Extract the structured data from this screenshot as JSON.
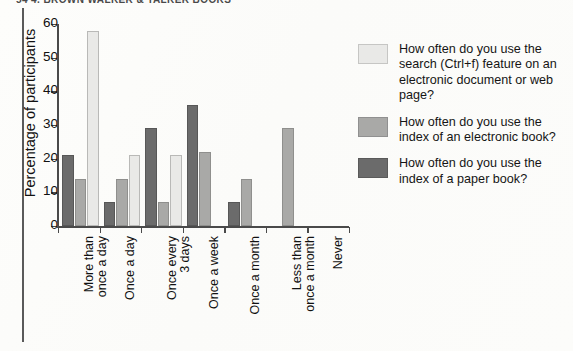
{
  "page": {
    "running_header": "54    4. BROWN WALKER & TALKER BOOKS"
  },
  "chart_data": {
    "type": "bar",
    "title": "",
    "subtitle": "",
    "xlabel": "",
    "ylabel": "Percentage of participants",
    "ylim": [
      0,
      60
    ],
    "yticks": [
      0,
      10,
      20,
      30,
      40,
      50,
      60
    ],
    "grid": false,
    "legend_position": "right",
    "categories": [
      "More than\nonce a day",
      "Once a day",
      "Once every\n3 days",
      "Once a week",
      "Once a month",
      "Less than\nonce a month",
      "Never"
    ],
    "series": [
      {
        "name": "How often do you use the search (Ctrl+f) feature on an electronic document or web page?",
        "color": "#e9e9e7",
        "values": [
          58,
          21,
          21,
          0,
          0,
          0,
          0
        ]
      },
      {
        "name": "How often do you use the index of an electronic book?",
        "color": "#a9a9a7",
        "values": [
          14,
          14,
          7,
          22,
          14,
          29,
          0
        ]
      },
      {
        "name": "How often do you use the index of a paper book?",
        "color": "#6b6b6b",
        "values": [
          21,
          7,
          29,
          36,
          7,
          0,
          0
        ]
      }
    ]
  },
  "legend": {
    "items": [
      {
        "swatch": "light-gray-swatch",
        "label": "How often do you use the search (Ctrl+f) feature on an electronic document or web page?"
      },
      {
        "swatch": "medium-gray-swatch",
        "label": "How often do you use the index of an electronic book?"
      },
      {
        "swatch": "dark-gray-swatch",
        "label": "How often do you use the index of a paper book?"
      }
    ]
  },
  "colors": {
    "series_light": "#e9e9e7",
    "series_medium": "#a9a9a7",
    "series_dark": "#6b6b6b",
    "axis": "#4a4a4a",
    "text": "#111111",
    "page_background": "#fdfdfc"
  }
}
